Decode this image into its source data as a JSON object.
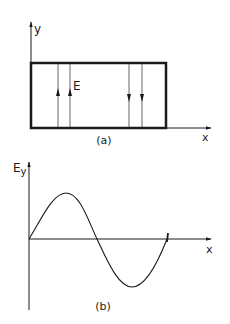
{
  "figure_a": {
    "caption": "(a)",
    "y_axis_label": "y",
    "x_axis_label": "x",
    "field_label": "E",
    "field_lines_up": 2,
    "field_lines_down": 2
  },
  "figure_b": {
    "caption": "(b)",
    "y_axis_label_main": "E",
    "y_axis_label_sub": "y",
    "x_axis_label": "x",
    "curve": "one full sine period starting at origin"
  },
  "colors": {
    "ink": "#1a1a1a",
    "field_line": "#555555",
    "background": "#ffffff"
  }
}
